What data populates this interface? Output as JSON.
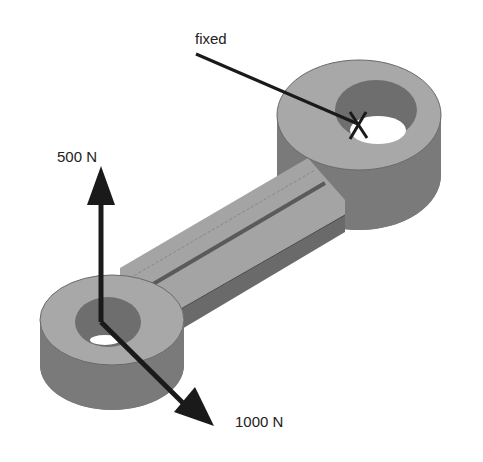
{
  "diagram": {
    "type": "mechanical-part-load-diagram",
    "part": "connecting-rod",
    "colors": {
      "face_top": "#a8a8a8",
      "face_side": "#7a7a7a",
      "hole_inner": "#6e6e6e",
      "arm_top": "#a4a4a4",
      "arm_side": "#6a6a6a",
      "arrow": "#1a1a1a",
      "background": "#ffffff"
    },
    "labels": {
      "fixed": "fixed",
      "force_vertical": "500 N",
      "force_diagonal": "1000 N"
    },
    "markers": {
      "fixed_marker": "X"
    }
  }
}
